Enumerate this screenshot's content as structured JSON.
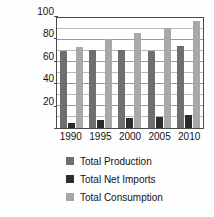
{
  "chart_data": {
    "type": "bar",
    "title": "",
    "xlabel": "",
    "ylabel": "BTUs, quadrillion",
    "categories": [
      "1990",
      "1995",
      "2000",
      "2005",
      "2010"
    ],
    "series": [
      {
        "name": "Total Production",
        "color": "#6f6f6f",
        "values": [
          70,
          71,
          71,
          70,
          75
        ]
      },
      {
        "name": "Total Net Imports",
        "color": "#2b2b2b",
        "values": [
          5,
          7,
          9,
          10,
          12
        ]
      },
      {
        "name": "Total Consumption",
        "color": "#a8a8a8",
        "values": [
          74,
          81,
          86,
          91,
          97
        ]
      }
    ],
    "ylim": [
      0,
      100
    ],
    "yticks": [
      0,
      20,
      40,
      60,
      80,
      100
    ],
    "ytick_labels": [
      "",
      "20",
      "40",
      "60",
      "80",
      "100"
    ],
    "yminor_ticks": [
      10,
      30,
      50,
      70,
      90
    ],
    "grid": true,
    "legend_position": "bottom"
  },
  "legend": {
    "items": [
      {
        "label": "Total Production"
      },
      {
        "label": "Total Net Imports"
      },
      {
        "label": "Total Consumption"
      }
    ]
  }
}
